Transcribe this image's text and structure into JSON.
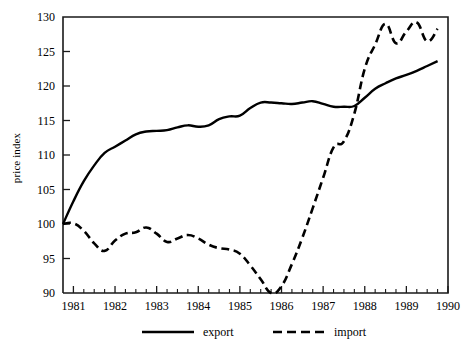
{
  "chart_data": {
    "type": "line",
    "title": "",
    "subtitle": "",
    "xlabel": "",
    "ylabel": "price index",
    "xlim": [
      1980.75,
      1990.0
    ],
    "ylim": [
      90,
      130
    ],
    "grid": false,
    "legend_position": "bottom",
    "x_tick_labels": [
      "1981",
      "1982",
      "1983",
      "1984",
      "1985",
      "1986",
      "1987",
      "1988",
      "1989",
      "1990"
    ],
    "x_tick_values": [
      1981,
      1982,
      1983,
      1984,
      1985,
      1986,
      1987,
      1988,
      1989,
      1990
    ],
    "x_minor_ticks_per_interval": 3,
    "y_tick_labels": [
      "90",
      "95",
      "100",
      "105",
      "110",
      "115",
      "120",
      "125",
      "130"
    ],
    "y_tick_values": [
      90,
      95,
      100,
      105,
      110,
      115,
      120,
      125,
      130
    ],
    "x": [
      1980.75,
      1981.0,
      1981.25,
      1981.5,
      1981.75,
      1982.0,
      1982.25,
      1982.5,
      1982.75,
      1983.0,
      1983.25,
      1983.5,
      1983.75,
      1984.0,
      1984.25,
      1984.5,
      1984.75,
      1985.0,
      1985.25,
      1985.5,
      1985.75,
      1986.0,
      1986.25,
      1986.5,
      1986.75,
      1987.0,
      1987.25,
      1987.5,
      1987.75,
      1988.0,
      1988.25,
      1988.5,
      1988.75,
      1989.0,
      1989.25,
      1989.5,
      1989.75
    ],
    "series": [
      {
        "name": "export",
        "style": "solid",
        "color": "#000000",
        "values": [
          100.0,
          103.3,
          106.2,
          108.5,
          110.3,
          111.2,
          112.1,
          113.0,
          113.4,
          113.5,
          113.6,
          114.0,
          114.3,
          114.1,
          114.3,
          115.2,
          115.6,
          115.7,
          116.8,
          117.6,
          117.6,
          117.5,
          117.4,
          117.6,
          117.8,
          117.4,
          117.0,
          117.0,
          117.1,
          118.3,
          119.6,
          120.4,
          121.1,
          121.6,
          122.2,
          122.9,
          123.6
        ]
      },
      {
        "name": "import",
        "style": "dashed",
        "color": "#000000",
        "values": [
          100.0,
          100.1,
          99.0,
          97.2,
          96.1,
          97.6,
          98.6,
          98.8,
          99.5,
          98.6,
          97.4,
          97.9,
          98.4,
          97.9,
          97.0,
          96.5,
          96.3,
          95.7,
          94.0,
          92.0,
          90.0,
          91.0,
          94.2,
          98.0,
          102.3,
          106.7,
          111.1,
          112.0,
          116.0,
          122.5,
          126.0,
          129.0,
          126.2,
          127.9,
          129.2,
          126.5,
          128.3
        ]
      }
    ]
  },
  "legend": {
    "entries": [
      {
        "label": "export",
        "style": "solid"
      },
      {
        "label": "import",
        "style": "dashed"
      }
    ]
  }
}
